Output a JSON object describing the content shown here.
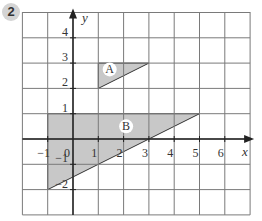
{
  "question_number": "2",
  "axes": {
    "x_label": "x",
    "y_label": "y",
    "x_ticks": [
      "-1",
      "0",
      "1",
      "2",
      "3",
      "4",
      "5",
      "6"
    ],
    "y_ticks": [
      "4",
      "3",
      "2",
      "1",
      "-1",
      "-2"
    ],
    "origin_label": "0",
    "x_range": [
      -2,
      7
    ],
    "y_range": [
      -3,
      5
    ]
  },
  "shapes": [
    {
      "label": "A",
      "vertices": [
        [
          1,
          2
        ],
        [
          1,
          3
        ],
        [
          3,
          3
        ]
      ],
      "fill": "#c8c8c8"
    },
    {
      "label": "B",
      "vertices": [
        [
          -1,
          1
        ],
        [
          5,
          1
        ],
        [
          -1,
          -2
        ]
      ],
      "fill": "#c8c8c8"
    }
  ],
  "colors": {
    "grid": "#7a7a7a",
    "axis": "#222222",
    "shape_fill": "#c8c8c8",
    "badge": "#d4d4d4"
  }
}
